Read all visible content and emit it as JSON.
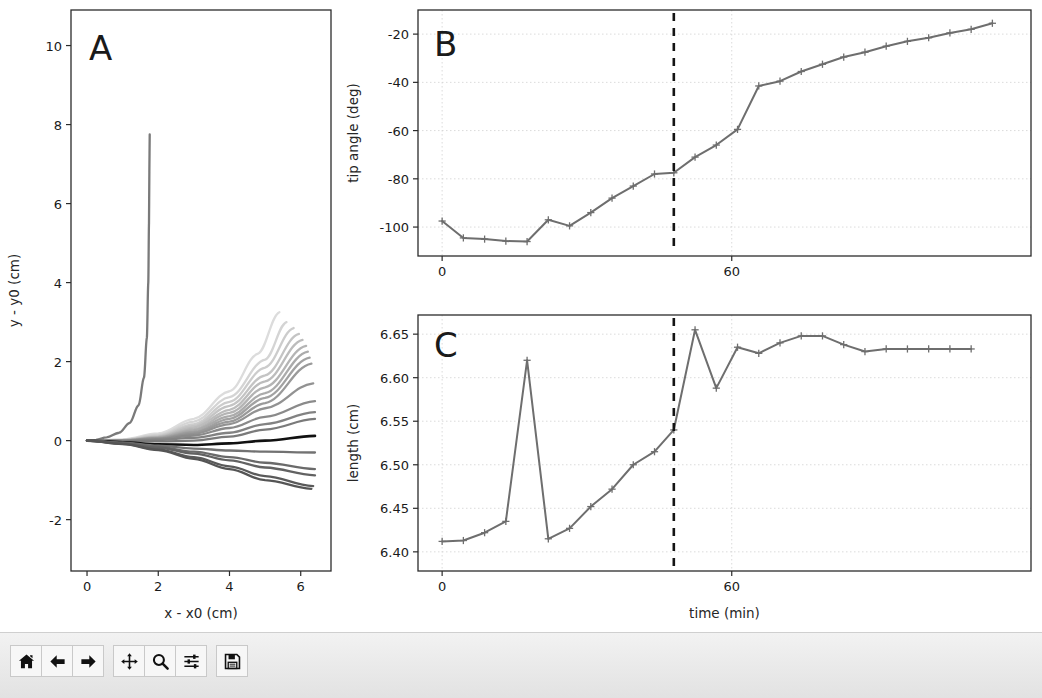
{
  "window": {
    "title": "Figure 1",
    "background": "#ffffff",
    "toolbar_background": "#e9e9e9"
  },
  "toolbar": {
    "buttons": [
      {
        "name": "home-icon",
        "label": "Home",
        "tooltip": "Reset original view"
      },
      {
        "name": "back-arrow-icon",
        "label": "Back",
        "tooltip": "Back to previous view"
      },
      {
        "name": "forward-arrow-icon",
        "label": "Forward",
        "tooltip": "Forward to next view"
      },
      {
        "name": "pan-move-icon",
        "label": "Pan",
        "tooltip": "Pan axes with left mouse, zoom with right"
      },
      {
        "name": "magnifier-icon",
        "label": "Zoom",
        "tooltip": "Zoom to rectangle"
      },
      {
        "name": "sliders-icon",
        "label": "Subplots",
        "tooltip": "Configure subplots"
      },
      {
        "name": "floppy-disk-icon",
        "label": "Save",
        "tooltip": "Save the figure"
      }
    ]
  },
  "chart_data": [
    {
      "panel": "A",
      "type": "line",
      "title": "",
      "xlabel": "x - x0 (cm)",
      "ylabel": "y - y0 (cm)",
      "xlim": [
        -0.45,
        6.85
      ],
      "ylim": [
        -3.3,
        10.9
      ],
      "xticks": [
        0,
        2,
        4,
        6
      ],
      "yticks": [
        -2,
        0,
        2,
        4,
        6,
        8,
        10
      ],
      "grid": false,
      "legend": "none",
      "description": "Family of plant-shoot centerline traces over time, fanning from the origin; color fades from light gray (early) to dark gray (late), with one highlighted black trace and one tall near-vertical trace.",
      "series": [
        {
          "name": "trace-vertical",
          "color": "#7a7a7a",
          "x": [
            0,
            0.25,
            0.55,
            0.9,
            1.2,
            1.45,
            1.6,
            1.68,
            1.72,
            1.74,
            1.75,
            1.76
          ],
          "y": [
            0,
            0.02,
            0.08,
            0.2,
            0.45,
            0.9,
            1.6,
            2.6,
            4.0,
            5.5,
            6.8,
            7.75
          ]
        },
        {
          "name": "trace-fan-01",
          "color": "#dcdcdc",
          "x": [
            0,
            1,
            2,
            3,
            4,
            4.8,
            5.4
          ],
          "y": [
            0,
            0.03,
            0.18,
            0.55,
            1.25,
            2.2,
            3.25
          ]
        },
        {
          "name": "trace-fan-02",
          "color": "#d4d4d4",
          "x": [
            0,
            1,
            2,
            3,
            4,
            5,
            5.6
          ],
          "y": [
            0,
            0.02,
            0.15,
            0.48,
            1.1,
            2.05,
            3.0
          ]
        },
        {
          "name": "trace-fan-03",
          "color": "#cccccc",
          "x": [
            0,
            1,
            2,
            3,
            4,
            5,
            5.8
          ],
          "y": [
            0,
            0.02,
            0.13,
            0.42,
            0.98,
            1.85,
            2.85
          ]
        },
        {
          "name": "trace-fan-04",
          "color": "#c4c4c4",
          "x": [
            0,
            1,
            2,
            3,
            4,
            5,
            5.95
          ],
          "y": [
            0,
            0.01,
            0.11,
            0.37,
            0.88,
            1.65,
            2.7
          ]
        },
        {
          "name": "trace-fan-05",
          "color": "#bcbcbc",
          "x": [
            0,
            1,
            2,
            3,
            4,
            5,
            6.05
          ],
          "y": [
            0,
            0.01,
            0.1,
            0.33,
            0.78,
            1.5,
            2.55
          ]
        },
        {
          "name": "trace-fan-06",
          "color": "#b4b4b4",
          "x": [
            0,
            1,
            2,
            3,
            4,
            5,
            6.15
          ],
          "y": [
            0,
            0.01,
            0.09,
            0.29,
            0.7,
            1.35,
            2.4
          ]
        },
        {
          "name": "trace-fan-07",
          "color": "#ababab",
          "x": [
            0,
            1,
            2,
            3,
            4,
            5,
            6.2
          ],
          "y": [
            0,
            0.0,
            0.08,
            0.26,
            0.62,
            1.2,
            2.25
          ]
        },
        {
          "name": "trace-fan-08",
          "color": "#a2a2a2",
          "x": [
            0,
            1,
            2,
            3,
            4,
            5,
            6.25
          ],
          "y": [
            0,
            0.0,
            0.07,
            0.22,
            0.55,
            1.08,
            2.1
          ]
        },
        {
          "name": "trace-fan-09",
          "color": "#9a9a9a",
          "x": [
            0,
            1,
            2,
            3,
            4,
            5,
            6.3
          ],
          "y": [
            0,
            0.0,
            0.06,
            0.2,
            0.48,
            0.95,
            1.95
          ]
        },
        {
          "name": "trace-fan-10",
          "color": "#929292",
          "x": [
            0,
            1,
            2,
            3,
            4,
            5,
            6.35
          ],
          "y": [
            0,
            0.0,
            0.05,
            0.17,
            0.42,
            0.82,
            1.45
          ]
        },
        {
          "name": "trace-fan-11",
          "color": "#8a8a8a",
          "x": [
            0,
            1,
            2,
            3,
            4,
            5,
            6.4
          ],
          "y": [
            0,
            0.0,
            0.04,
            0.13,
            0.32,
            0.6,
            1.0
          ]
        },
        {
          "name": "trace-fan-12",
          "color": "#828282",
          "x": [
            0,
            1,
            2,
            3,
            4,
            5,
            6.4
          ],
          "y": [
            0,
            -0.01,
            0.02,
            0.07,
            0.2,
            0.42,
            0.72
          ]
        },
        {
          "name": "trace-fan-13",
          "color": "#7a7a7a",
          "x": [
            0,
            1,
            2,
            3,
            4,
            5,
            6.4
          ],
          "y": [
            0,
            -0.02,
            -0.02,
            0.0,
            0.1,
            0.28,
            0.55
          ]
        },
        {
          "name": "trace-highlight-black",
          "color": "#111111",
          "x": [
            0,
            1,
            2,
            3,
            4,
            5,
            6.4
          ],
          "y": [
            0,
            -0.04,
            -0.09,
            -0.11,
            -0.07,
            0.0,
            0.12
          ]
        },
        {
          "name": "trace-fan-14",
          "color": "#727272",
          "x": [
            0,
            1,
            2,
            3,
            4,
            5,
            6.4
          ],
          "y": [
            0,
            -0.05,
            -0.13,
            -0.2,
            -0.25,
            -0.28,
            -0.3
          ]
        },
        {
          "name": "trace-fan-15",
          "color": "#6a6a6a",
          "x": [
            0,
            1,
            2,
            3,
            4,
            5,
            6.4
          ],
          "y": [
            0,
            -0.06,
            -0.16,
            -0.28,
            -0.42,
            -0.56,
            -0.72
          ]
        },
        {
          "name": "trace-fan-16",
          "color": "#626262",
          "x": [
            0,
            1,
            2,
            3,
            4,
            5,
            6.4
          ],
          "y": [
            0,
            -0.07,
            -0.18,
            -0.33,
            -0.5,
            -0.68,
            -0.88
          ]
        },
        {
          "name": "trace-fan-17",
          "color": "#5a5a5a",
          "x": [
            0,
            1,
            2,
            3,
            4,
            5,
            6.35
          ],
          "y": [
            0,
            -0.08,
            -0.22,
            -0.42,
            -0.65,
            -0.9,
            -1.15
          ]
        },
        {
          "name": "trace-fan-18",
          "color": "#555555",
          "x": [
            0,
            1,
            2,
            3,
            4,
            5,
            6.3
          ],
          "y": [
            0,
            -0.09,
            -0.24,
            -0.46,
            -0.72,
            -1.0,
            -1.22
          ]
        }
      ]
    },
    {
      "panel": "B",
      "type": "line",
      "title": "",
      "xlabel": "",
      "ylabel": "tip angle (deg)",
      "xlim": [
        -5,
        122
      ],
      "ylim": [
        -112,
        -10
      ],
      "xticks": [
        0,
        60
      ],
      "yticks": [
        -100,
        -80,
        -60,
        -40,
        -20
      ],
      "grid": true,
      "legend": "none",
      "marker": "plus",
      "line_color": "#6e6e6e",
      "annotations": [
        {
          "name": "transition-vline",
          "type": "vertical-dashed-line",
          "x": 48,
          "color": "#141414"
        }
      ],
      "x": [
        0,
        4.4,
        8.8,
        13.2,
        17.6,
        22,
        26.4,
        30.8,
        35.2,
        39.6,
        44,
        48,
        52.4,
        56.8,
        61.2,
        65.6,
        70,
        74.4,
        78.8,
        83.2,
        87.6,
        92,
        96.4,
        100.8,
        105.2,
        109.6,
        114
      ],
      "values": [
        -97.5,
        -104.5,
        -105.0,
        -105.8,
        -106.0,
        -97.0,
        -99.5,
        -94.0,
        -88.0,
        -83.0,
        -78.0,
        -77.5,
        -71.0,
        -66.0,
        -59.5,
        -41.5,
        -39.5,
        -35.5,
        -32.5,
        -29.5,
        -27.5,
        -25.0,
        -23.0,
        -21.5,
        -19.5,
        -18.0,
        -15.5
      ]
    },
    {
      "panel": "C",
      "type": "line",
      "title": "",
      "xlabel": "time (min)",
      "ylabel": "length (cm)",
      "xlim": [
        -5,
        122
      ],
      "ylim": [
        6.378,
        6.672
      ],
      "xticks": [
        0,
        60
      ],
      "yticks": [
        6.4,
        6.45,
        6.5,
        6.55,
        6.6,
        6.65
      ],
      "grid": true,
      "legend": "none",
      "marker": "plus",
      "line_color": "#6e6e6e",
      "annotations": [
        {
          "name": "transition-vline",
          "type": "vertical-dashed-line",
          "x": 48,
          "color": "#141414"
        }
      ],
      "x": [
        0,
        4.4,
        8.8,
        13.2,
        17.6,
        22,
        26.4,
        30.8,
        35.2,
        39.6,
        44,
        48,
        52.4,
        56.8,
        61.2,
        65.6,
        70,
        74.4,
        78.8,
        83.2,
        87.6,
        92,
        96.4,
        100.8,
        105.2,
        109.6
      ],
      "values": [
        6.412,
        6.413,
        6.422,
        6.435,
        6.62,
        6.415,
        6.427,
        6.452,
        6.472,
        6.5,
        6.515,
        6.54,
        6.655,
        6.588,
        6.635,
        6.628,
        6.64,
        6.648,
        6.648,
        6.638,
        6.63,
        6.633,
        6.633,
        6.633,
        6.633,
        6.633
      ]
    }
  ]
}
